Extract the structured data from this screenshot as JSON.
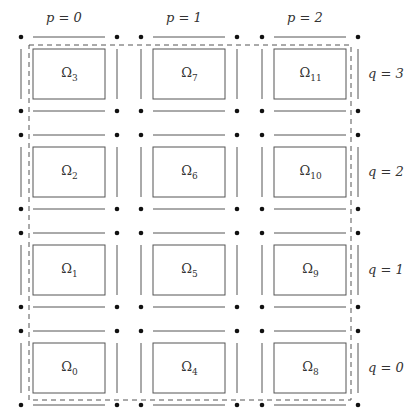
{
  "diagram": {
    "col_labels": [
      "p = 0",
      "p = 1",
      "p = 2"
    ],
    "row_labels": [
      "q = 3",
      "q = 2",
      "q = 1",
      "q = 0"
    ],
    "subdomains": [
      [
        "Ω",
        "3"
      ],
      [
        "Ω",
        "7"
      ],
      [
        "Ω",
        "11"
      ],
      [
        "Ω",
        "2"
      ],
      [
        "Ω",
        "6"
      ],
      [
        "Ω",
        "10"
      ],
      [
        "Ω",
        "1"
      ],
      [
        "Ω",
        "5"
      ],
      [
        "Ω",
        "9"
      ],
      [
        "Ω",
        "0"
      ],
      [
        "Ω",
        "4"
      ],
      [
        "Ω",
        "8"
      ]
    ],
    "colors": {
      "stroke": "#555555",
      "dot": "#111111",
      "dashed": "#555555"
    }
  }
}
